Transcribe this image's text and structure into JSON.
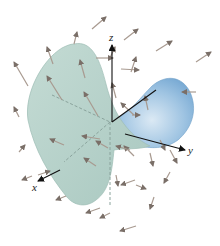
{
  "figure": {
    "axes": {
      "x_label": "x",
      "y_label": "y",
      "z_label": "z"
    },
    "colors": {
      "surface_front": "#b9d3cc",
      "surface_front_edge": "#9ebdb5",
      "surface_back": "#8fb8dc",
      "surface_back_light": "#d6e6f3",
      "arrow": "#a89a90",
      "arrow_head": "#7a6f68",
      "axis": "#111111",
      "dashed": "#8aa39c"
    }
  }
}
